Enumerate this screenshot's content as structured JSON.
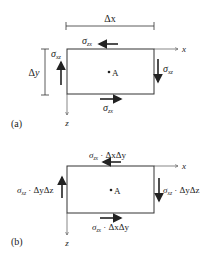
{
  "panel_a": {
    "label": "(a)",
    "dim_x": "Δx",
    "dim_y": "Δy",
    "axis_x": "x",
    "axis_z": "z",
    "point": "A",
    "top_stress": {
      "symbol": "σ",
      "sub": "zx",
      "direction": "left"
    },
    "bottom_stress": {
      "symbol": "σ",
      "sub": "zx",
      "direction": "right"
    },
    "left_stress": {
      "symbol": "σ",
      "sub": "xz",
      "direction": "up"
    },
    "right_stress": {
      "symbol": "σ",
      "sub": "xz",
      "direction": "down"
    }
  },
  "panel_b": {
    "label": "(b)",
    "axis_x": "x",
    "axis_z": "z",
    "point": "A",
    "top_force": {
      "symbol": "σ",
      "sub": "zx",
      "factor": " · ΔxΔy",
      "direction": "left"
    },
    "bottom_force": {
      "symbol": "σ",
      "sub": "zx",
      "factor": " · ΔxΔy",
      "direction": "right"
    },
    "left_force": {
      "symbol": "σ",
      "sub": "xz",
      "factor": " · ΔyΔz",
      "direction": "up"
    },
    "right_force": {
      "symbol": "σ",
      "sub": "xz",
      "factor": " · ΔyΔz",
      "direction": "down"
    }
  },
  "colors": {
    "line": "#333333",
    "text": "#222222",
    "background": "#ffffff"
  }
}
